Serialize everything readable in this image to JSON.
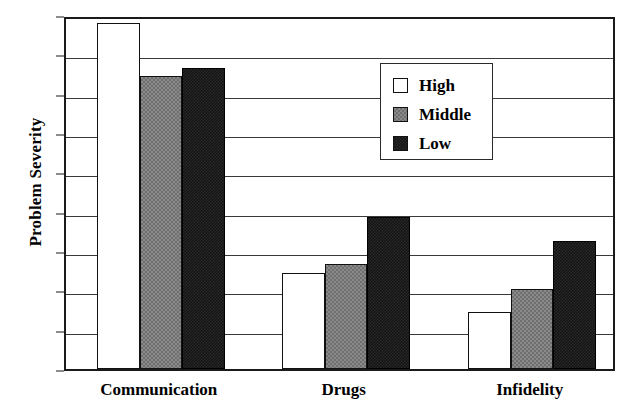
{
  "chart_data": {
    "type": "bar",
    "title": "",
    "xlabel": "",
    "ylabel": "Problem Severity",
    "categories": [
      "Communication",
      "Drugs",
      "Infidelity"
    ],
    "series": [
      {
        "name": "High",
        "values": [
          44.0,
          12.2,
          7.2
        ],
        "color": "#ffffff"
      },
      {
        "name": "Middle",
        "values": [
          37.3,
          13.3,
          10.2
        ],
        "color": "#808080"
      },
      {
        "name": "Low",
        "values": [
          38.3,
          19.3,
          16.3
        ],
        "color": "#111111"
      }
    ],
    "ylim": [
      0,
      45
    ],
    "yticks": [
      0,
      5,
      10,
      15,
      20,
      25,
      30,
      35,
      40,
      45
    ],
    "ytick_labels": [
      "0",
      "5",
      "10",
      "15",
      "20",
      "25",
      "30",
      "35",
      "40",
      "45"
    ],
    "grid": true,
    "grid_axis": "y",
    "legend_position": "upper center",
    "legend_entries": [
      "High",
      "Middle",
      "Low"
    ]
  }
}
